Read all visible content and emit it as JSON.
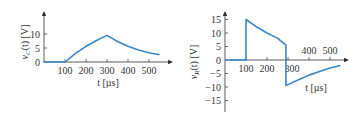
{
  "chart_data": [
    {
      "type": "line",
      "title": "",
      "xlabel": "t [µs]",
      "ylabel": "v_C(t) [V]",
      "ylabel_main": "v",
      "ylabel_sub": "C",
      "ylabel_rest": "(t)  [V]",
      "xticks": [
        100,
        200,
        300,
        400,
        500
      ],
      "xtick_labels": [
        "100",
        "200",
        "300",
        "400",
        "500"
      ],
      "yticks": [
        0,
        5,
        10
      ],
      "ytick_labels": [
        "0",
        "5",
        "10"
      ],
      "xlim": [
        0,
        600
      ],
      "ylim": [
        0,
        15
      ],
      "color": "#3a86c8",
      "grid": false,
      "x": [
        0,
        100,
        150,
        200,
        250,
        300,
        350,
        400,
        450,
        500,
        550
      ],
      "y": [
        0,
        0,
        3.1,
        5.6,
        7.7,
        9.5,
        7.3,
        5.6,
        4.3,
        3.3,
        2.6
      ]
    },
    {
      "type": "line",
      "title": "",
      "xlabel": "t [µs]",
      "ylabel": "v_R(t) [V]",
      "ylabel_main": "v",
      "ylabel_sub": "R",
      "ylabel_rest": "(t)  [V]",
      "xticks": [
        100,
        200,
        300,
        400,
        500
      ],
      "xtick_labels": [
        "100",
        "200",
        "300",
        "400",
        "500"
      ],
      "yticks": [
        -15,
        -10,
        -5,
        0,
        5,
        10,
        15
      ],
      "ytick_labels": [
        "−15",
        "−10",
        "−5",
        "0",
        "5",
        "10",
        "15"
      ],
      "xlim": [
        0,
        600
      ],
      "ylim": [
        -18,
        18
      ],
      "color": "#3a86c8",
      "grid": false,
      "x": [
        0,
        100,
        100,
        150,
        200,
        250,
        290,
        290,
        350,
        400,
        450,
        500,
        550
      ],
      "y": [
        0,
        0,
        15,
        12.3,
        10,
        8.1,
        5.5,
        -9.5,
        -7.3,
        -5.6,
        -4.3,
        -3.0,
        -2.0
      ]
    }
  ]
}
